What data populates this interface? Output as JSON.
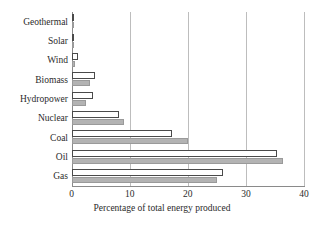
{
  "chart_data": {
    "type": "bar",
    "orientation": "horizontal",
    "title": "",
    "xlabel": "Percentage of total energy produced",
    "ylabel": "",
    "xlim": [
      0,
      40
    ],
    "xticks": [
      0,
      10,
      20,
      30,
      40
    ],
    "xtick_labels": [
      "0",
      "10",
      "20",
      "30",
      "40"
    ],
    "grid": "vertical",
    "legend": "none",
    "categories": [
      "Geothermal",
      "Solar",
      "Wind",
      "Biomass",
      "Hydropower",
      "Nuclear",
      "Coal",
      "Oil",
      "Gas"
    ],
    "series": [
      {
        "name": "primary",
        "style": "white-fill-dark-outline",
        "color": "#ffffff",
        "edge_color": "#4a4a4a",
        "values": [
          0.3,
          0.3,
          1.2,
          4.0,
          3.7,
          8.2,
          17.3,
          35.4,
          26.0
        ]
      },
      {
        "name": "secondary",
        "style": "gray-fill",
        "color": "#b3b3b3",
        "edge_color": "#9a9a9a",
        "values": [
          0.2,
          0.2,
          0.6,
          3.2,
          2.5,
          9.0,
          20.0,
          36.4,
          25.0
        ]
      }
    ]
  },
  "axis_title": "Percentage of total energy produced",
  "colors": {
    "gridline": "#bdbdbd",
    "axis": "#8a8a8a",
    "bar_primary_fill": "#ffffff",
    "bar_primary_edge": "#4a4a4a",
    "bar_secondary_fill": "#b3b3b3",
    "bar_secondary_edge": "#9a9a9a",
    "text": "#2b2b2b",
    "background": "#ffffff"
  }
}
